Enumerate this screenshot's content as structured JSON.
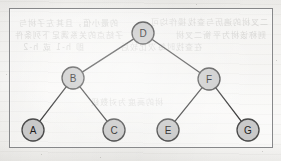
{
  "figure": {
    "type": "binary-tree-diagram",
    "title": "",
    "frame": {
      "x": 9,
      "y": 8,
      "width": 264,
      "height": 140,
      "border_color": "#87888a"
    },
    "background_color": "#f3f2ef"
  },
  "style": {
    "node_fill": "#c9c9c9",
    "node_stroke": "#4a4a4a",
    "node_radius": 11,
    "edge_color": "#3a3a3a",
    "label_color": "#1d1d1d"
  },
  "chart_data": {
    "type": "diagram",
    "subtype": "binary-tree",
    "root": "D",
    "nodes": [
      {
        "id": "D",
        "label": "D",
        "x": 143,
        "y": 33,
        "depth": 0
      },
      {
        "id": "B",
        "label": "B",
        "x": 73,
        "y": 78,
        "depth": 1
      },
      {
        "id": "F",
        "label": "F",
        "x": 209,
        "y": 79,
        "depth": 1
      },
      {
        "id": "A",
        "label": "A",
        "x": 33,
        "y": 130,
        "depth": 2
      },
      {
        "id": "C",
        "label": "C",
        "x": 114,
        "y": 130,
        "depth": 2
      },
      {
        "id": "E",
        "label": "E",
        "x": 168,
        "y": 130,
        "depth": 2
      },
      {
        "id": "G",
        "label": "G",
        "x": 248,
        "y": 130,
        "depth": 2
      }
    ],
    "edges": [
      {
        "from": "D",
        "to": "B",
        "side": "left"
      },
      {
        "from": "D",
        "to": "F",
        "side": "right"
      },
      {
        "from": "B",
        "to": "A",
        "side": "left"
      },
      {
        "from": "B",
        "to": "C",
        "side": "right"
      },
      {
        "from": "F",
        "to": "E",
        "side": "left"
      },
      {
        "from": "F",
        "to": "G",
        "side": "right"
      }
    ],
    "inorder": [
      "A",
      "B",
      "C",
      "D",
      "E",
      "F",
      "G"
    ],
    "title": "",
    "legend": []
  },
  "ghost_text": {
    "note": "faint mirrored bleed-through from reverse side of scanned page",
    "lines": [
      {
        "text": "的最小值，且其左子树与",
        "x": 18,
        "y": 17,
        "size": 8,
        "opacity": 0.26
      },
      {
        "text": "二叉树的遍历与查找操作均可",
        "x": 150,
        "y": 16,
        "size": 8,
        "opacity": 0.24
      },
      {
        "text": "子结点的关系满足下列条件",
        "x": 14,
        "y": 29,
        "size": 8,
        "opacity": 0.25
      },
      {
        "text": "则称该树为平衡二叉树",
        "x": 175,
        "y": 29,
        "size": 8,
        "opacity": 0.23
      },
      {
        "text": "即 h-1 或 h-2",
        "x": 22,
        "y": 41,
        "size": 8,
        "opacity": 0.22
      },
      {
        "text": "在查找时每次比较后",
        "x": 120,
        "y": 41,
        "size": 8,
        "opacity": 0.22
      },
      {
        "text": "树的高度为对数级",
        "x": 90,
        "y": 96,
        "size": 8,
        "opacity": 0.2
      }
    ]
  },
  "specks": [
    {
      "x": 262,
      "y": 151,
      "size": 1.4
    },
    {
      "x": 41,
      "y": 154,
      "size": 1.2
    },
    {
      "x": 6,
      "y": 74,
      "size": 1.1
    },
    {
      "x": 276,
      "y": 60,
      "size": 1.2
    },
    {
      "x": 100,
      "y": 157,
      "size": 1.0
    },
    {
      "x": 196,
      "y": 4,
      "size": 1.0
    }
  ]
}
